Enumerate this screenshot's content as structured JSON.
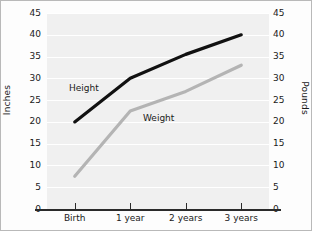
{
  "chart_data": {
    "type": "line",
    "title": "",
    "xlabel": "",
    "categories": [
      "Birth",
      "1 year",
      "2 years",
      "3 years"
    ],
    "grid": true,
    "legend_position": "inline",
    "axes": {
      "left": {
        "label": "Inches",
        "ticks": [
          0,
          5,
          10,
          15,
          20,
          25,
          30,
          35,
          40,
          45
        ],
        "ylim": [
          0,
          45
        ]
      },
      "right": {
        "label": "Pounds",
        "ticks": [
          0,
          5,
          10,
          15,
          20,
          25,
          30,
          35,
          40,
          45
        ],
        "ylim": [
          0,
          45
        ]
      }
    },
    "series": [
      {
        "name": "Height",
        "unit": "Inches",
        "axis": "left",
        "color": "#111111",
        "values": [
          20,
          30,
          35.5,
          40
        ]
      },
      {
        "name": "Weight",
        "unit": "Pounds",
        "axis": "right",
        "color": "#b4b4b4",
        "values": [
          7.5,
          22.5,
          27,
          33
        ]
      }
    ]
  },
  "labels": {
    "tick_0": "0",
    "tick_5": "5",
    "tick_10": "10",
    "tick_15": "15",
    "tick_20": "20",
    "tick_25": "25",
    "tick_30": "30",
    "tick_35": "35",
    "tick_40": "40",
    "tick_45": "45"
  }
}
